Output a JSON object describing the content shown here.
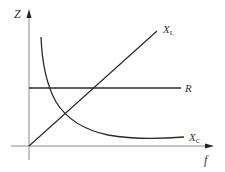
{
  "diagram": {
    "axes": {
      "y_label": "Z",
      "x_label": "f"
    },
    "curves": [
      {
        "id": "XL",
        "label_main": "X",
        "label_sub": "L",
        "shape": "line-through-origin"
      },
      {
        "id": "R",
        "label_main": "R",
        "label_sub": "",
        "shape": "horizontal-line"
      },
      {
        "id": "XC",
        "label_main": "X",
        "label_sub": "C",
        "shape": "hyperbola"
      }
    ],
    "colors": {
      "axis": "#8a8a8a",
      "curve": "#2a2a2a",
      "label": "#333333"
    }
  }
}
